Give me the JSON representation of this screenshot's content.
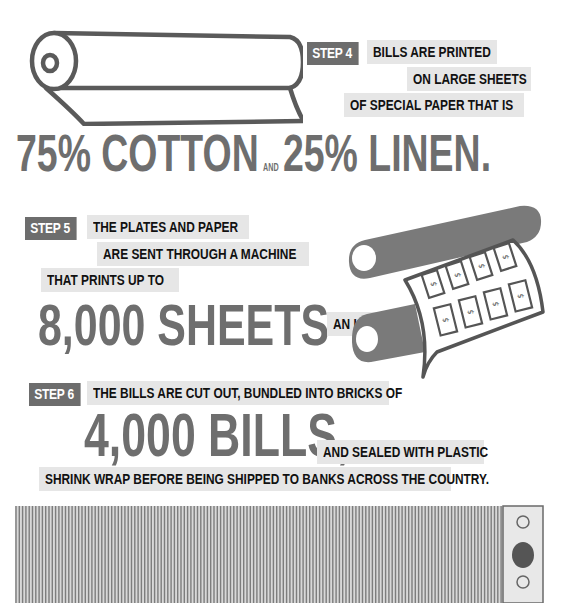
{
  "step4": {
    "badge": "STEP 4",
    "lines": [
      "BILLS ARE PRINTED",
      "ON LARGE SHEETS",
      "OF SPECIAL PAPER THAT IS"
    ],
    "headline_part1": "75% COTTON",
    "connector": "AND",
    "headline_part2": "25% LINEN."
  },
  "step5": {
    "badge": "STEP 5",
    "lines": [
      "THE PLATES AND PAPER",
      "ARE SENT THROUGH A MACHINE",
      "THAT PRINTS UP TO"
    ],
    "headline": "8,000 SHEETS",
    "suffix": "AN HOUR.",
    "bill_symbol": "$"
  },
  "step6": {
    "badge": "STEP 6",
    "line1": "THE BILLS ARE CUT OUT, BUNDLED INTO BRICKS OF",
    "headline": "4,000 BILLS,",
    "line2": "AND SEALED WITH PLASTIC",
    "line3": "SHRINK WRAP BEFORE BEING SHIPPED TO BANKS ACROSS THE COUNTRY."
  },
  "colors": {
    "badge": "#6d6d6d",
    "caption_bg": "#e6e6e6",
    "headline": "#6e6e6e",
    "illustration": "#555555",
    "roller": "#7a7a7a"
  }
}
